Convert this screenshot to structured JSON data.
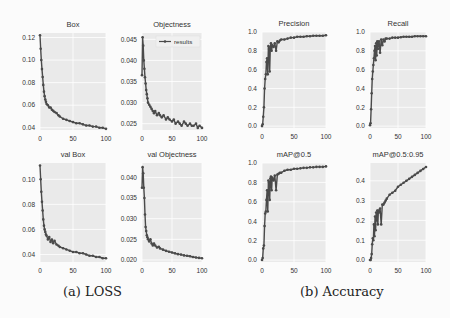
{
  "captions": {
    "loss": "(a) LOSS",
    "accuracy": "(b) Accuracy"
  },
  "colors": {
    "line": "#4a4a4a",
    "plot_bg": "#eaeaea",
    "grid": "#ffffff",
    "text": "#333333"
  },
  "legend_label": "results",
  "chart_data": [
    {
      "type": "line",
      "title": "Box",
      "group": "LOSS",
      "xlim": [
        0,
        100
      ],
      "ylim": [
        0.038,
        0.124
      ],
      "xticks": [
        0,
        50,
        100
      ],
      "yticks": [
        0.04,
        0.06,
        0.08,
        0.1,
        0.12
      ],
      "ytick_labels": [
        "0.04",
        "0.06",
        "0.08",
        "0.10",
        "0.12"
      ],
      "grid": true,
      "x": [
        0,
        1,
        2,
        3,
        4,
        5,
        6,
        7,
        8,
        9,
        10,
        12,
        14,
        16,
        18,
        20,
        22,
        25,
        28,
        30,
        35,
        40,
        45,
        50,
        55,
        60,
        65,
        70,
        75,
        80,
        85,
        90,
        95,
        100
      ],
      "y": [
        0.122,
        0.11,
        0.1,
        0.092,
        0.085,
        0.078,
        0.072,
        0.068,
        0.065,
        0.063,
        0.061,
        0.06,
        0.058,
        0.058,
        0.056,
        0.055,
        0.054,
        0.053,
        0.051,
        0.05,
        0.048,
        0.047,
        0.046,
        0.045,
        0.044,
        0.044,
        0.043,
        0.042,
        0.042,
        0.041,
        0.041,
        0.04,
        0.04,
        0.039
      ]
    },
    {
      "type": "line",
      "title": "Objectness",
      "group": "LOSS",
      "xlim": [
        0,
        100
      ],
      "ylim": [
        0.0235,
        0.0465
      ],
      "xticks": [
        0,
        50,
        100
      ],
      "yticks": [
        0.025,
        0.03,
        0.035,
        0.04,
        0.045
      ],
      "ytick_labels": [
        "0.025",
        "0.030",
        "0.035",
        "0.040",
        "0.045"
      ],
      "grid": true,
      "legend": {
        "label": "results",
        "position": "top-right"
      },
      "x": [
        0,
        1,
        2,
        3,
        4,
        5,
        6,
        7,
        8,
        9,
        10,
        12,
        14,
        16,
        18,
        20,
        22,
        25,
        28,
        30,
        33,
        36,
        40,
        43,
        46,
        50,
        53,
        56,
        60,
        63,
        66,
        70,
        73,
        76,
        80,
        83,
        86,
        90,
        93,
        96,
        100
      ],
      "y": [
        0.0365,
        0.0455,
        0.0435,
        0.04,
        0.038,
        0.036,
        0.0345,
        0.033,
        0.032,
        0.031,
        0.03,
        0.0295,
        0.029,
        0.0285,
        0.028,
        0.0275,
        0.028,
        0.027,
        0.0275,
        0.027,
        0.0265,
        0.027,
        0.026,
        0.0265,
        0.026,
        0.0255,
        0.026,
        0.025,
        0.0255,
        0.025,
        0.0245,
        0.0255,
        0.025,
        0.0245,
        0.025,
        0.0245,
        0.0245,
        0.025,
        0.024,
        0.0245,
        0.024
      ]
    },
    {
      "type": "line",
      "title": "val Box",
      "group": "LOSS",
      "xlim": [
        0,
        100
      ],
      "ylim": [
        0.034,
        0.113
      ],
      "xticks": [
        0,
        50,
        100
      ],
      "yticks": [
        0.04,
        0.06,
        0.08,
        0.1
      ],
      "ytick_labels": [
        "0.04",
        "0.06",
        "0.08",
        "0.10"
      ],
      "grid": true,
      "x": [
        0,
        1,
        2,
        3,
        4,
        5,
        6,
        7,
        8,
        9,
        10,
        12,
        14,
        16,
        18,
        20,
        22,
        25,
        28,
        30,
        35,
        40,
        45,
        50,
        55,
        60,
        65,
        70,
        75,
        80,
        85,
        90,
        95,
        100
      ],
      "y": [
        0.111,
        0.1,
        0.09,
        0.082,
        0.075,
        0.068,
        0.063,
        0.06,
        0.058,
        0.056,
        0.055,
        0.052,
        0.054,
        0.05,
        0.052,
        0.049,
        0.051,
        0.048,
        0.047,
        0.046,
        0.045,
        0.044,
        0.043,
        0.042,
        0.042,
        0.041,
        0.041,
        0.04,
        0.039,
        0.039,
        0.038,
        0.038,
        0.037,
        0.037
      ]
    },
    {
      "type": "line",
      "title": "val Objectness",
      "group": "LOSS",
      "xlim": [
        0,
        100
      ],
      "ylim": [
        0.0195,
        0.0435
      ],
      "xticks": [
        0,
        50,
        100
      ],
      "yticks": [
        0.02,
        0.025,
        0.03,
        0.035,
        0.04
      ],
      "ytick_labels": [
        "0.020",
        "0.025",
        "0.030",
        "0.035",
        "0.040"
      ],
      "grid": true,
      "x": [
        0,
        1,
        2,
        3,
        4,
        5,
        6,
        7,
        8,
        9,
        10,
        12,
        14,
        16,
        18,
        20,
        22,
        25,
        28,
        30,
        35,
        40,
        45,
        50,
        55,
        60,
        65,
        70,
        75,
        80,
        85,
        90,
        95,
        100
      ],
      "y": [
        0.0375,
        0.0425,
        0.041,
        0.0375,
        0.035,
        0.031,
        0.028,
        0.027,
        0.026,
        0.0255,
        0.025,
        0.0245,
        0.025,
        0.024,
        0.0235,
        0.024,
        0.0235,
        0.023,
        0.0232,
        0.0228,
        0.0225,
        0.0222,
        0.022,
        0.0218,
        0.0216,
        0.0214,
        0.0213,
        0.0211,
        0.021,
        0.0209,
        0.0207,
        0.0206,
        0.0205,
        0.0204
      ]
    },
    {
      "type": "line",
      "title": "Precision",
      "group": "Accuracy",
      "xlim": [
        0,
        100
      ],
      "ylim": [
        -0.02,
        1.0
      ],
      "xticks": [
        0,
        50,
        100
      ],
      "yticks": [
        0.0,
        0.2,
        0.4,
        0.6,
        0.8,
        1.0
      ],
      "ytick_labels": [
        "0.0",
        "0.2",
        "0.4",
        "0.6",
        "0.8",
        "1.0"
      ],
      "grid": true,
      "x": [
        0,
        1,
        2,
        3,
        4,
        5,
        6,
        7,
        8,
        9,
        10,
        11,
        12,
        13,
        14,
        15,
        16,
        18,
        20,
        22,
        24,
        26,
        28,
        30,
        35,
        40,
        45,
        50,
        55,
        60,
        65,
        70,
        75,
        80,
        85,
        90,
        95,
        100
      ],
      "y": [
        0.0,
        0.02,
        0.1,
        0.2,
        0.4,
        0.5,
        0.55,
        0.68,
        0.72,
        0.55,
        0.85,
        0.82,
        0.58,
        0.84,
        0.88,
        0.8,
        0.86,
        0.84,
        0.88,
        0.8,
        0.9,
        0.89,
        0.91,
        0.92,
        0.92,
        0.93,
        0.94,
        0.94,
        0.95,
        0.95,
        0.95,
        0.955,
        0.955,
        0.96,
        0.96,
        0.96,
        0.96,
        0.965
      ]
    },
    {
      "type": "line",
      "title": "Recall",
      "group": "Accuracy",
      "xlim": [
        0,
        100
      ],
      "ylim": [
        -0.02,
        1.0
      ],
      "xticks": [
        0,
        50,
        100
      ],
      "yticks": [
        0.0,
        0.2,
        0.4,
        0.6,
        0.8,
        1.0
      ],
      "ytick_labels": [
        "0.0",
        "0.2",
        "0.4",
        "0.6",
        "0.8",
        "1.0"
      ],
      "grid": true,
      "x": [
        0,
        1,
        2,
        3,
        4,
        5,
        6,
        7,
        8,
        9,
        10,
        11,
        12,
        13,
        14,
        15,
        16,
        18,
        20,
        22,
        24,
        26,
        28,
        30,
        35,
        40,
        45,
        50,
        55,
        60,
        65,
        70,
        75,
        80,
        85,
        90,
        95,
        100
      ],
      "y": [
        0.01,
        0.03,
        0.18,
        0.35,
        0.5,
        0.58,
        0.65,
        0.72,
        0.8,
        0.85,
        0.7,
        0.88,
        0.75,
        0.9,
        0.82,
        0.88,
        0.9,
        0.78,
        0.92,
        0.86,
        0.92,
        0.9,
        0.93,
        0.93,
        0.93,
        0.94,
        0.94,
        0.94,
        0.945,
        0.95,
        0.95,
        0.95,
        0.95,
        0.955,
        0.955,
        0.955,
        0.955,
        0.955
      ]
    },
    {
      "type": "line",
      "title": "mAP@0.5",
      "group": "Accuracy",
      "xlim": [
        0,
        100
      ],
      "ylim": [
        -0.02,
        1.0
      ],
      "xticks": [
        0,
        50,
        100
      ],
      "yticks": [
        0.0,
        0.2,
        0.4,
        0.6,
        0.8,
        1.0
      ],
      "ytick_labels": [
        "0.0",
        "0.2",
        "0.4",
        "0.6",
        "0.8",
        "1.0"
      ],
      "grid": true,
      "x": [
        0,
        1,
        2,
        3,
        4,
        5,
        6,
        7,
        8,
        9,
        10,
        11,
        12,
        13,
        14,
        15,
        16,
        18,
        20,
        22,
        24,
        26,
        28,
        30,
        35,
        40,
        45,
        50,
        55,
        60,
        65,
        70,
        75,
        80,
        85,
        90,
        95,
        100
      ],
      "y": [
        0.0,
        0.02,
        0.12,
        0.15,
        0.35,
        0.48,
        0.5,
        0.62,
        0.72,
        0.5,
        0.82,
        0.8,
        0.62,
        0.84,
        0.86,
        0.72,
        0.85,
        0.82,
        0.87,
        0.72,
        0.88,
        0.89,
        0.9,
        0.9,
        0.92,
        0.93,
        0.93,
        0.94,
        0.94,
        0.945,
        0.95,
        0.95,
        0.955,
        0.955,
        0.96,
        0.96,
        0.96,
        0.965
      ]
    },
    {
      "type": "line",
      "title": "mAP@0.5:0.95",
      "group": "Accuracy",
      "xlim": [
        0,
        100
      ],
      "ylim": [
        -0.01,
        0.49
      ],
      "xticks": [
        0,
        50,
        100
      ],
      "yticks": [
        0.0,
        0.1,
        0.2,
        0.3,
        0.4
      ],
      "ytick_labels": [
        "0.0",
        "0.1",
        "0.2",
        "0.3",
        "0.4"
      ],
      "grid": true,
      "x": [
        0,
        1,
        2,
        3,
        4,
        5,
        6,
        7,
        8,
        9,
        10,
        11,
        12,
        13,
        14,
        15,
        16,
        18,
        20,
        22,
        24,
        26,
        28,
        30,
        35,
        40,
        45,
        50,
        55,
        60,
        65,
        70,
        75,
        80,
        85,
        90,
        95,
        100
      ],
      "y": [
        0.0,
        0.0,
        0.01,
        0.03,
        0.08,
        0.11,
        0.1,
        0.18,
        0.12,
        0.22,
        0.15,
        0.24,
        0.2,
        0.25,
        0.18,
        0.25,
        0.24,
        0.26,
        0.18,
        0.28,
        0.28,
        0.29,
        0.3,
        0.31,
        0.33,
        0.34,
        0.35,
        0.37,
        0.38,
        0.39,
        0.4,
        0.41,
        0.42,
        0.43,
        0.44,
        0.45,
        0.46,
        0.47
      ]
    }
  ]
}
